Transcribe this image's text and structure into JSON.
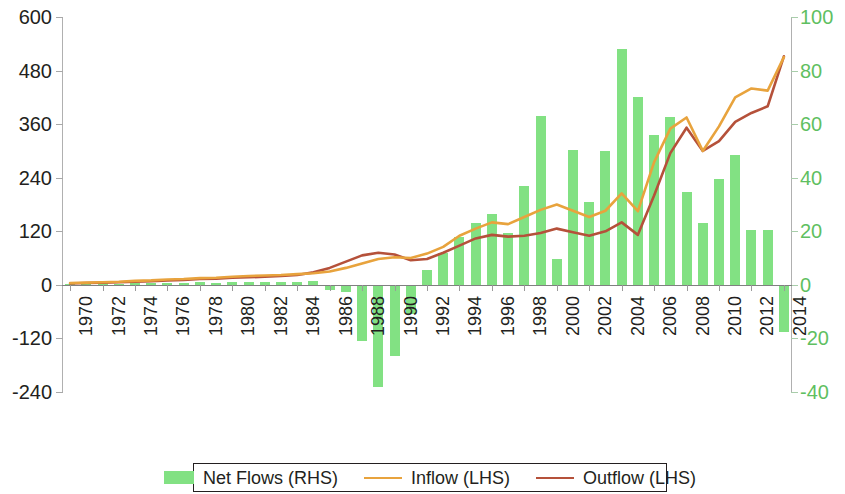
{
  "chart_data": {
    "type": "bar",
    "title": "",
    "subtitle": "",
    "xlabel": "",
    "ylabel": "",
    "grid": false,
    "legend_position": "bottom",
    "x": [
      1970,
      1971,
      1972,
      1973,
      1974,
      1975,
      1976,
      1977,
      1978,
      1979,
      1980,
      1981,
      1982,
      1983,
      1984,
      1985,
      1986,
      1987,
      1988,
      1989,
      1990,
      1991,
      1992,
      1993,
      1994,
      1995,
      1996,
      1997,
      1998,
      1999,
      2000,
      2001,
      2002,
      2003,
      2004,
      2005,
      2006,
      2007,
      2008,
      2009,
      2010,
      2011,
      2012,
      2013,
      2014
    ],
    "tick_labels_x": [
      "1970",
      "1972",
      "1974",
      "1976",
      "1978",
      "1980",
      "1982",
      "1984",
      "1986",
      "1988",
      "1990",
      "1992",
      "1994",
      "1996",
      "1998",
      "2000",
      "2002",
      "2004",
      "2006",
      "2008",
      "2010",
      "2012",
      "2014"
    ],
    "axes": {
      "left": {
        "name": "LHS",
        "ticks": [
          600,
          480,
          360,
          240,
          120,
          0,
          -120,
          -240
        ],
        "tick_labels": [
          "600",
          "480",
          "360",
          "240",
          "120",
          "0",
          "-120",
          "-240"
        ],
        "limits": [
          -240,
          600
        ],
        "tick_color": "#231f20"
      },
      "right": {
        "name": "RHS",
        "ticks": [
          100,
          80,
          60,
          40,
          20,
          0,
          -20,
          -40
        ],
        "tick_labels": [
          "100",
          "80",
          "60",
          "40",
          "20",
          "0",
          "-20",
          "-40"
        ],
        "limits": [
          -40,
          100
        ],
        "tick_color": "#5fbf61"
      }
    },
    "series": [
      {
        "name": "Net Flows (RHS)",
        "type": "bar",
        "axis": "right",
        "color": "#82e183",
        "values": [
          0.5,
          0.4,
          0.6,
          0.5,
          0.7,
          0.6,
          0.8,
          0.7,
          0.9,
          0.8,
          1.0,
          1.1,
          0.9,
          1.0,
          1.2,
          1.5,
          -2.0,
          -2.5,
          -21.0,
          -38.0,
          -26.5,
          -11.0,
          5.5,
          12.0,
          18.0,
          23.0,
          26.5,
          19.5,
          37.0,
          63.0,
          9.5,
          50.5,
          31.0,
          50.0,
          88.0,
          70.0,
          56.0,
          62.5,
          34.5,
          23.0,
          39.5,
          48.5,
          20.5,
          20.5,
          -17.5
        ]
      },
      {
        "name": "Inflow (LHS)",
        "type": "line",
        "axis": "left",
        "color": "#e8a33d",
        "values": [
          4,
          5,
          6,
          7,
          9,
          10,
          12,
          13,
          15,
          16,
          18,
          20,
          21,
          22,
          24,
          26,
          30,
          38,
          48,
          58,
          62,
          60,
          70,
          85,
          110,
          126,
          140,
          136,
          152,
          168,
          180,
          166,
          152,
          166,
          205,
          165,
          275,
          350,
          375,
          300,
          355,
          420,
          440,
          435,
          510
        ]
      },
      {
        "name": "Outflow (LHS)",
        "type": "line",
        "axis": "left",
        "color": "#b5513a",
        "values": [
          3,
          4,
          5,
          6,
          7,
          8,
          10,
          11,
          13,
          14,
          16,
          17,
          18,
          20,
          22,
          28,
          38,
          52,
          66,
          72,
          68,
          55,
          58,
          72,
          88,
          104,
          112,
          108,
          110,
          116,
          126,
          118,
          110,
          120,
          140,
          112,
          200,
          295,
          352,
          300,
          322,
          365,
          385,
          400,
          512
        ]
      }
    ]
  },
  "legend": {
    "items": [
      {
        "label": "Net Flows (RHS)",
        "marker": "bar-swatch",
        "color": "#82e183"
      },
      {
        "label": "Inflow (LHS)",
        "marker": "line-swatch",
        "color": "#e8a33d"
      },
      {
        "label": "Outflow (LHS)",
        "marker": "line-swatch",
        "color": "#b5513a"
      }
    ]
  }
}
